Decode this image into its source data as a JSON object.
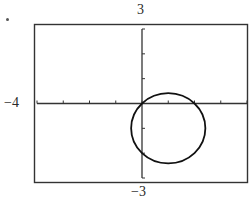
{
  "chart_data": {
    "type": "line",
    "title": "",
    "xlabel": "",
    "ylabel": "",
    "xlim": [
      -4,
      4
    ],
    "ylim": [
      -3,
      3
    ],
    "window_labels": {
      "xmin": "−4",
      "ymax": "3",
      "ymin": "−3"
    },
    "x_ticks": [
      -4,
      -3,
      -2,
      -1,
      0,
      1,
      2,
      3,
      4
    ],
    "y_ticks": [
      -3,
      -2,
      -1,
      0,
      1,
      2,
      3
    ],
    "grid": false,
    "legend": null,
    "series": [
      {
        "name": "circle",
        "shape": "circle",
        "center": [
          1,
          -1
        ],
        "radius": 1.414,
        "equation": "(x-1)^2 + (y+1)^2 = 2",
        "passes_through": [
          [
            0,
            0
          ],
          [
            2,
            0
          ],
          [
            0,
            -2
          ]
        ]
      }
    ]
  },
  "colors": {
    "curve": "#111111",
    "axes": "#333333",
    "frame": "#333333",
    "background": "#ffffff"
  }
}
